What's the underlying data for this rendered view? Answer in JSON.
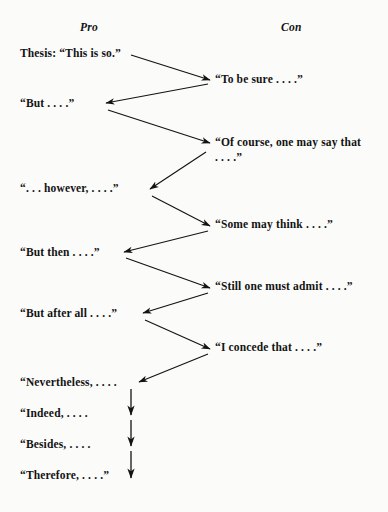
{
  "diagram": {
    "background_color": "#fbfbfa",
    "ink_color": "#131313",
    "columns": {
      "pro_label": "Pro",
      "con_label": "Con"
    },
    "pro_nodes": [
      {
        "text": "Thesis: “This is so.”",
        "top": 46
      },
      {
        "text": "“But . . . .”",
        "top": 96
      },
      {
        "text": "“. . . however, . . . .”",
        "top": 181
      },
      {
        "text": "“But then . . . .”",
        "top": 245
      },
      {
        "text": "“But after all . . . .”",
        "top": 306
      },
      {
        "text": "“Nevertheless, . . . .",
        "top": 375
      },
      {
        "text": "“Indeed, . . . .",
        "top": 406
      },
      {
        "text": "“Besides, . . . .",
        "top": 437
      },
      {
        "text": "“Therefore, . . . .”",
        "top": 468
      }
    ],
    "con_nodes": [
      {
        "text": "“To be sure . . . .”",
        "top": 72
      },
      {
        "text": "“Of course, one may say that . . . .”",
        "top": 135
      },
      {
        "text": "“Some may think . . . .”",
        "top": 217
      },
      {
        "text": "“Still one must admit . . . .”",
        "top": 279
      },
      {
        "text": "“I concede that . . . .”",
        "top": 340
      }
    ],
    "zigzag_arrows": [
      {
        "name": "thesis-to-to-be-sure",
        "x1": 131,
        "y1": 55,
        "x2": 210,
        "y2": 80
      },
      {
        "name": "to-be-sure-to-but",
        "x1": 208,
        "y1": 84,
        "x2": 106,
        "y2": 103
      },
      {
        "name": "but-to-of-course",
        "x1": 108,
        "y1": 110,
        "x2": 210,
        "y2": 143
      },
      {
        "name": "of-course-to-however",
        "x1": 206,
        "y1": 152,
        "x2": 150,
        "y2": 189
      },
      {
        "name": "however-to-some-may-think",
        "x1": 152,
        "y1": 196,
        "x2": 210,
        "y2": 226
      },
      {
        "name": "some-may-think-to-but-then",
        "x1": 208,
        "y1": 231,
        "x2": 124,
        "y2": 252
      },
      {
        "name": "but-then-to-still-one-must",
        "x1": 126,
        "y1": 258,
        "x2": 210,
        "y2": 288
      },
      {
        "name": "still-one-must-to-after-all",
        "x1": 208,
        "y1": 293,
        "x2": 143,
        "y2": 313
      },
      {
        "name": "after-all-to-i-concede",
        "x1": 145,
        "y1": 320,
        "x2": 210,
        "y2": 349
      },
      {
        "name": "i-concede-to-nevertheless",
        "x1": 208,
        "y1": 354,
        "x2": 139,
        "y2": 382
      }
    ],
    "vertical_arrows": [
      {
        "name": "nevertheless-to-indeed",
        "x": 131,
        "y1": 389,
        "y2": 415
      },
      {
        "name": "indeed-to-besides",
        "x": 131,
        "y1": 420,
        "y2": 446
      },
      {
        "name": "besides-to-therefore",
        "x": 131,
        "y1": 451,
        "y2": 478
      }
    ]
  }
}
